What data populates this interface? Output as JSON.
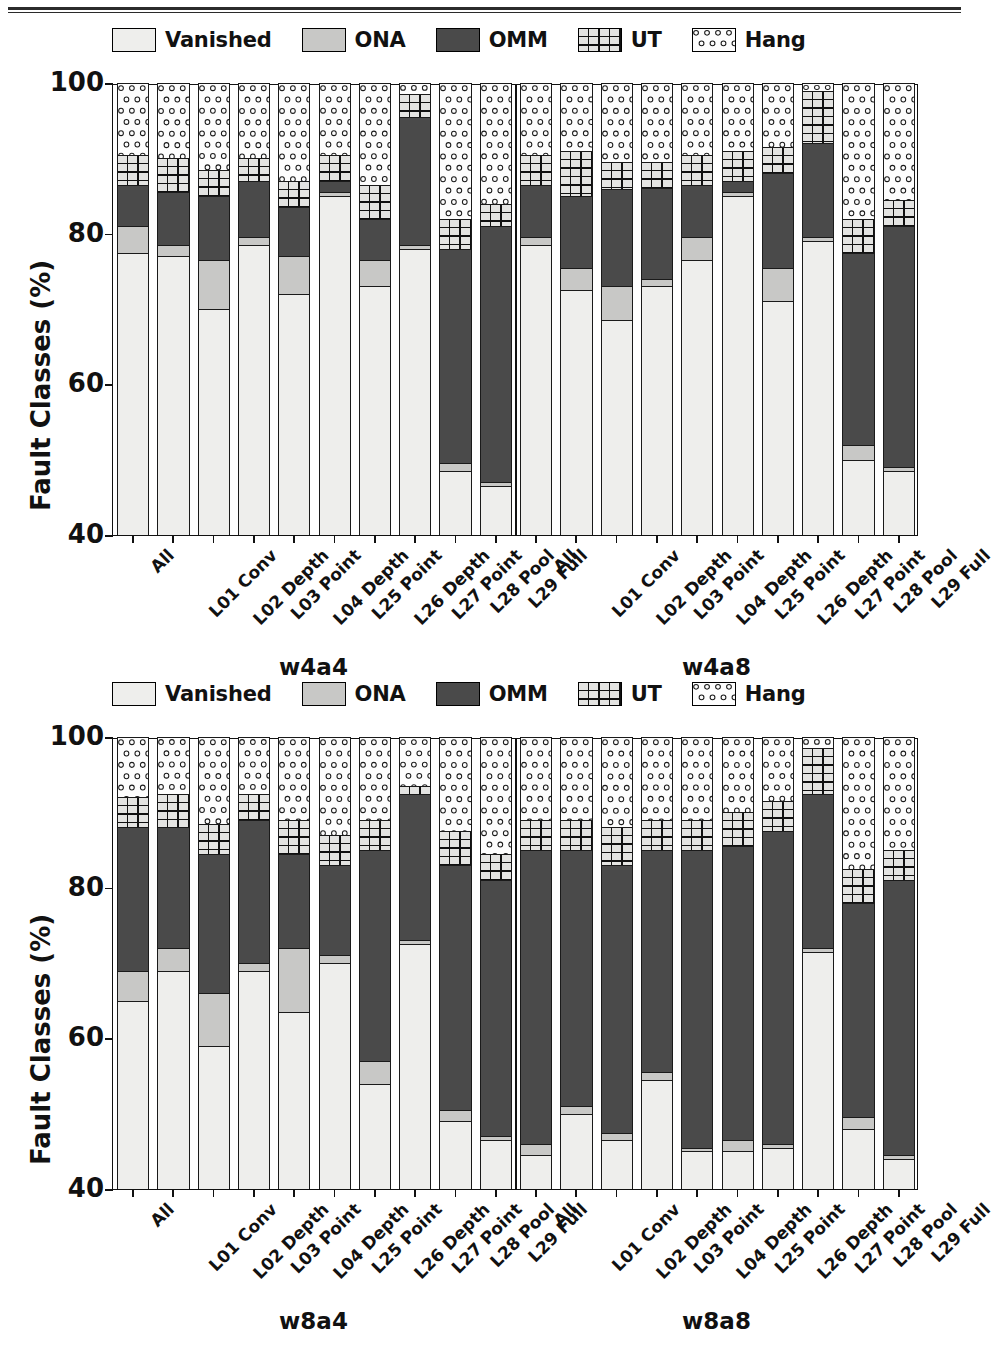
{
  "figure": {
    "legend": [
      {
        "label": "Vanished",
        "swatch": "light-gray-plain",
        "color": "#eeeeec"
      },
      {
        "label": "ONA",
        "swatch": "medium-gray-plain",
        "color": "#c8c8c6"
      },
      {
        "label": "OMM",
        "swatch": "dark-gray-plain",
        "color": "#4a4a4a"
      },
      {
        "label": "UT",
        "swatch": "grid-hatch",
        "color": "#e4e4e2"
      },
      {
        "label": "Hang",
        "swatch": "circle-dots",
        "color": "#fdfdfd"
      }
    ],
    "ylabel": "Fault Classes (%)",
    "yticks": [
      "100",
      "80",
      "60",
      "40"
    ],
    "xticklabels": [
      "All",
      "L01 Conv",
      "L02 Depth",
      "L03 Point",
      "L04 Depth",
      "L25 Point",
      "L26 Depth",
      "L27 Point",
      "L28 Pool",
      "L29 Full"
    ],
    "panels": [
      {
        "groups": [
          "w4a4",
          "w4a8"
        ]
      },
      {
        "groups": [
          "w8a4",
          "w8a8"
        ]
      }
    ]
  },
  "chart_data": {
    "type": "bar",
    "subtype": "stacked-bar-100-percent-truncated-axis",
    "title": "",
    "xlabel": "",
    "ylabel": "Fault Classes (%)",
    "ylim": [
      40,
      100
    ],
    "yticks": [
      40,
      60,
      80,
      100
    ],
    "grid": false,
    "legend_position": "above-axes",
    "series_order": [
      "Vanished",
      "ONA",
      "OMM",
      "UT",
      "Hang"
    ],
    "series_colors": {
      "Vanished": "#eeeeec",
      "ONA": "#c8c8c6",
      "OMM": "#4a4a4a",
      "UT": "#e4e4e2",
      "Hang": "#fdfdfd"
    },
    "categories": [
      "All",
      "L01 Conv",
      "L02 Depth",
      "L03 Point",
      "L04 Depth",
      "L25 Point",
      "L26 Depth",
      "L27 Point",
      "L28 Pool",
      "L29 Full"
    ],
    "panels": [
      {
        "panel_label": "top",
        "groups": [
          {
            "name": "w4a4",
            "bars": [
              {
                "category": "All",
                "Vanished": 77.5,
                "ONA": 3.5,
                "OMM": 5.5,
                "UT": 4.0,
                "Hang": 9.5
              },
              {
                "category": "L01 Conv",
                "Vanished": 77.0,
                "ONA": 1.5,
                "OMM": 7.0,
                "UT": 4.5,
                "Hang": 10.0
              },
              {
                "category": "L02 Depth",
                "Vanished": 70.0,
                "ONA": 6.5,
                "OMM": 8.5,
                "UT": 3.5,
                "Hang": 11.5
              },
              {
                "category": "L03 Point",
                "Vanished": 78.5,
                "ONA": 1.0,
                "OMM": 7.5,
                "UT": 3.0,
                "Hang": 10.0
              },
              {
                "category": "L04 Depth",
                "Vanished": 72.0,
                "ONA": 5.0,
                "OMM": 6.5,
                "UT": 3.5,
                "Hang": 13.0
              },
              {
                "category": "L25 Point",
                "Vanished": 85.0,
                "ONA": 0.5,
                "OMM": 1.5,
                "UT": 3.5,
                "Hang": 9.5
              },
              {
                "category": "L26 Depth",
                "Vanished": 73.0,
                "ONA": 3.5,
                "OMM": 5.5,
                "UT": 4.5,
                "Hang": 13.5
              },
              {
                "category": "L27 Point",
                "Vanished": 78.0,
                "ONA": 0.5,
                "OMM": 17.0,
                "UT": 3.0,
                "Hang": 1.5
              },
              {
                "category": "L28 Pool",
                "Vanished": 48.5,
                "ONA": 1.0,
                "OMM": 28.5,
                "UT": 4.0,
                "Hang": 18.0
              },
              {
                "category": "L29 Full",
                "Vanished": 46.5,
                "ONA": 0.5,
                "OMM": 34.0,
                "UT": 3.0,
                "Hang": 16.0
              }
            ]
          },
          {
            "name": "w4a8",
            "bars": [
              {
                "category": "All",
                "Vanished": 78.5,
                "ONA": 1.0,
                "OMM": 7.0,
                "UT": 4.0,
                "Hang": 9.5
              },
              {
                "category": "L01 Conv",
                "Vanished": 72.5,
                "ONA": 3.0,
                "OMM": 9.5,
                "UT": 6.0,
                "Hang": 9.0
              },
              {
                "category": "L02 Depth",
                "Vanished": 68.5,
                "ONA": 4.5,
                "OMM": 13.0,
                "UT": 3.5,
                "Hang": 10.5
              },
              {
                "category": "L03 Point",
                "Vanished": 73.0,
                "ONA": 1.0,
                "OMM": 12.0,
                "UT": 3.5,
                "Hang": 10.5
              },
              {
                "category": "L04 Depth",
                "Vanished": 76.5,
                "ONA": 3.0,
                "OMM": 7.0,
                "UT": 4.0,
                "Hang": 9.5
              },
              {
                "category": "L25 Point",
                "Vanished": 85.0,
                "ONA": 0.5,
                "OMM": 1.5,
                "UT": 4.0,
                "Hang": 9.0
              },
              {
                "category": "L26 Depth",
                "Vanished": 71.0,
                "ONA": 4.5,
                "OMM": 12.5,
                "UT": 3.5,
                "Hang": 8.5
              },
              {
                "category": "L27 Point",
                "Vanished": 79.0,
                "ONA": 0.5,
                "OMM": 12.5,
                "UT": 7.0,
                "Hang": 1.0
              },
              {
                "category": "L28 Pool",
                "Vanished": 50.0,
                "ONA": 2.0,
                "OMM": 25.5,
                "UT": 4.5,
                "Hang": 18.0
              },
              {
                "category": "L29 Full",
                "Vanished": 48.5,
                "ONA": 0.5,
                "OMM": 32.0,
                "UT": 3.5,
                "Hang": 15.5
              }
            ]
          }
        ]
      },
      {
        "panel_label": "bottom",
        "groups": [
          {
            "name": "w8a4",
            "bars": [
              {
                "category": "All",
                "Vanished": 65.0,
                "ONA": 4.0,
                "OMM": 19.0,
                "UT": 4.0,
                "Hang": 8.0
              },
              {
                "category": "L01 Conv",
                "Vanished": 69.0,
                "ONA": 3.0,
                "OMM": 16.0,
                "UT": 4.5,
                "Hang": 7.5
              },
              {
                "category": "L02 Depth",
                "Vanished": 59.0,
                "ONA": 7.0,
                "OMM": 18.5,
                "UT": 4.0,
                "Hang": 11.5
              },
              {
                "category": "L03 Point",
                "Vanished": 69.0,
                "ONA": 1.0,
                "OMM": 19.0,
                "UT": 3.5,
                "Hang": 7.5
              },
              {
                "category": "L04 Depth",
                "Vanished": 63.5,
                "ONA": 8.5,
                "OMM": 12.5,
                "UT": 4.5,
                "Hang": 11.0
              },
              {
                "category": "L25 Point",
                "Vanished": 70.0,
                "ONA": 1.0,
                "OMM": 12.0,
                "UT": 4.0,
                "Hang": 13.0
              },
              {
                "category": "L26 Depth",
                "Vanished": 54.0,
                "ONA": 3.0,
                "OMM": 28.0,
                "UT": 4.0,
                "Hang": 11.0
              },
              {
                "category": "L27 Point",
                "Vanished": 72.5,
                "ONA": 0.5,
                "OMM": 19.5,
                "UT": 1.0,
                "Hang": 6.5
              },
              {
                "category": "L28 Pool",
                "Vanished": 49.0,
                "ONA": 1.5,
                "OMM": 32.5,
                "UT": 4.5,
                "Hang": 12.5
              },
              {
                "category": "L29 Full",
                "Vanished": 46.5,
                "ONA": 0.5,
                "OMM": 34.0,
                "UT": 3.5,
                "Hang": 15.5
              }
            ]
          },
          {
            "name": "w8a8",
            "bars": [
              {
                "category": "All",
                "Vanished": 44.5,
                "ONA": 1.5,
                "OMM": 39.0,
                "UT": 4.0,
                "Hang": 11.0
              },
              {
                "category": "L01 Conv",
                "Vanished": 50.0,
                "ONA": 1.0,
                "OMM": 34.0,
                "UT": 4.0,
                "Hang": 11.0
              },
              {
                "category": "L02 Depth",
                "Vanished": 46.5,
                "ONA": 1.0,
                "OMM": 35.5,
                "UT": 5.0,
                "Hang": 12.0
              },
              {
                "category": "L03 Point",
                "Vanished": 54.5,
                "ONA": 1.0,
                "OMM": 29.5,
                "UT": 4.0,
                "Hang": 11.0
              },
              {
                "category": "L04 Depth",
                "Vanished": 45.0,
                "ONA": 0.5,
                "OMM": 39.5,
                "UT": 4.0,
                "Hang": 11.0
              },
              {
                "category": "L25 Point",
                "Vanished": 45.0,
                "ONA": 1.5,
                "OMM": 39.0,
                "UT": 4.5,
                "Hang": 10.0
              },
              {
                "category": "L26 Depth",
                "Vanished": 45.5,
                "ONA": 0.5,
                "OMM": 41.5,
                "UT": 4.0,
                "Hang": 8.5
              },
              {
                "category": "L27 Point",
                "Vanished": 71.5,
                "ONA": 0.5,
                "OMM": 20.5,
                "UT": 6.0,
                "Hang": 1.5
              },
              {
                "category": "L28 Pool",
                "Vanished": 48.0,
                "ONA": 1.5,
                "OMM": 28.5,
                "UT": 4.5,
                "Hang": 17.5
              },
              {
                "category": "L29 Full",
                "Vanished": 44.0,
                "ONA": 0.5,
                "OMM": 36.5,
                "UT": 4.0,
                "Hang": 15.0
              }
            ]
          }
        ]
      }
    ]
  }
}
